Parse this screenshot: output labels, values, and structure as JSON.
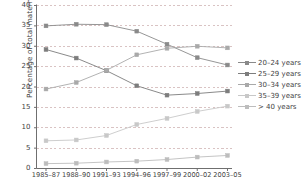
{
  "chart_data": {
    "type": "line",
    "title": "",
    "xlabel": "",
    "ylabel": "Percentage of total maternities",
    "categories": [
      "1985–87",
      "1988–90",
      "1991–93",
      "1994–96",
      "1997–99",
      "2000–02",
      "2003–05"
    ],
    "ylim": [
      0,
      40
    ],
    "yticks": [
      0,
      5,
      10,
      15,
      20,
      25,
      30,
      35,
      40
    ],
    "grid": "horizontal-dashed",
    "legend_position": "right",
    "series": [
      {
        "name": "20–24 years",
        "color": "#8a8a8a",
        "marker": "square",
        "values": [
          35.0,
          35.4,
          35.3,
          33.7,
          30.5,
          27.2,
          25.4
        ]
      },
      {
        "name": "25–29 years",
        "color": "#7d7d7d",
        "marker": "square",
        "values": [
          29.2,
          27.1,
          24.0,
          20.3,
          18.0,
          18.4,
          19.0
        ]
      },
      {
        "name": "30–34 years",
        "color": "#a9a9a9",
        "marker": "square",
        "values": [
          19.5,
          21.1,
          24.1,
          27.9,
          29.5,
          30.0,
          29.6
        ]
      },
      {
        "name": "35–39 years",
        "color": "#c8c8c8",
        "marker": "square",
        "values": [
          6.8,
          7.0,
          8.1,
          10.8,
          12.3,
          14.0,
          15.3
        ]
      },
      {
        "name": "> 40 years",
        "color": "#bdbdbd",
        "marker": "square",
        "values": [
          1.2,
          1.3,
          1.6,
          1.8,
          2.2,
          2.8,
          3.2
        ]
      }
    ]
  },
  "axis": {
    "tick_labels_y": [
      "40",
      "35",
      "30",
      "25",
      "20",
      "15",
      "10",
      "5",
      "0"
    ],
    "tick_labels_x": [
      "1985–87",
      "1988–90",
      "1991–93",
      "1994–96",
      "1997–99",
      "2000–02",
      "2003–05"
    ],
    "y_axis_title": "Percentage of total maternities"
  },
  "legend": {
    "items": [
      {
        "label": "20–24 years",
        "color": "#8a8a8a"
      },
      {
        "label": "25–29 years",
        "color": "#7d7d7d"
      },
      {
        "label": "30–34 years",
        "color": "#a9a9a9"
      },
      {
        "label": "35–39 years",
        "color": "#c8c8c8"
      },
      {
        "label": "> 40 years",
        "color": "#bdbdbd"
      }
    ]
  },
  "style": {
    "grid_color": "#c9a9a9",
    "axis_color": "#6f6f6f",
    "text_color": "#3f3f3f",
    "background": "#ffffff"
  }
}
